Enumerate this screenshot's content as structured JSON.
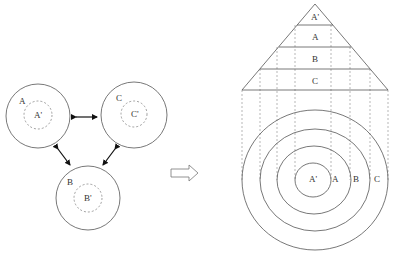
{
  "left_diagram": {
    "circles": [
      {
        "id": "A",
        "outer_label": "A",
        "inner_label": "A'",
        "cx": 38,
        "cy": 116,
        "r": 32,
        "inner_r": 14,
        "lx": 20,
        "ly": 104
      },
      {
        "id": "C",
        "outer_label": "C",
        "inner_label": "C'",
        "cx": 134,
        "cy": 115,
        "r": 33,
        "inner_r": 13,
        "lx": 117,
        "ly": 100
      },
      {
        "id": "B",
        "outer_label": "B",
        "inner_label": "B'",
        "cx": 88,
        "cy": 198,
        "r": 32,
        "inner_r": 14,
        "lx": 67,
        "ly": 184
      }
    ],
    "arrows": [
      {
        "name": "arrow-a-c",
        "x1": 75,
        "y1": 117,
        "x2": 97,
        "y2": 117
      },
      {
        "name": "arrow-a-b",
        "x1": 57,
        "y1": 148,
        "x2": 70,
        "y2": 165
      },
      {
        "name": "arrow-c-b",
        "x1": 116,
        "y1": 148,
        "x2": 103,
        "y2": 165
      }
    ]
  },
  "transition_arrow": {
    "icon": "hollow-right-arrow"
  },
  "pyramid": {
    "layers": [
      {
        "label": "A'"
      },
      {
        "label": "A"
      },
      {
        "label": "B"
      },
      {
        "label": "C"
      }
    ]
  },
  "concentric": {
    "labels": [
      "A'",
      "A",
      "B",
      "C"
    ]
  },
  "colors": {
    "line": "#555555",
    "dashed": "#888888",
    "arrow": "#111111"
  }
}
